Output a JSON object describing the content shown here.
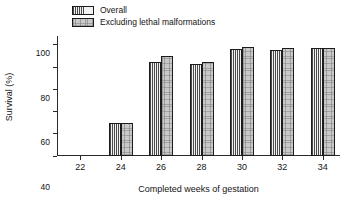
{
  "chart_data": {
    "type": "bar",
    "title": "",
    "subtitle": "",
    "xlabel": "Completed weeks of gestation",
    "ylabel": "Survival (%)",
    "categories": [
      "22",
      "24",
      "26",
      "28",
      "30",
      "32",
      "34"
    ],
    "series": [
      {
        "name": "Overall",
        "fill": "dotted",
        "color": "#f2f2f2",
        "values": [
          0,
          30,
          85,
          82.5,
          96,
          95,
          97.5
        ]
      },
      {
        "name": "Excluding lethal malformations",
        "fill": "gray-solid",
        "color": "#c9c9c9",
        "values": [
          0,
          30,
          90,
          84.5,
          98,
          97.5,
          97.5
        ]
      }
    ],
    "ylim": [
      0,
      108
    ],
    "yticks": [
      0,
      20,
      40,
      60,
      80,
      100
    ],
    "ytick_labels": [
      "0",
      "20",
      "40",
      "60",
      "80",
      "100"
    ],
    "grid": false,
    "legend_position": "top-left"
  },
  "legend": {
    "items": [
      {
        "label": "Overall"
      },
      {
        "label": "Excluding lethal malformations"
      }
    ]
  },
  "axes": {
    "y_title": "Survival (%)",
    "x_title": "Completed weeks of gestation"
  },
  "colors": {
    "axis": "#2b2b2b",
    "text": "#141414",
    "series_overall": "#f2f2f2",
    "series_excluding": "#c9c9c9"
  }
}
